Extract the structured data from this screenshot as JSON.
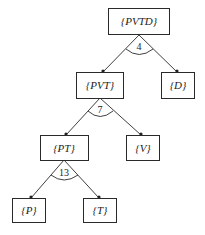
{
  "diagram": {
    "type": "and-decomposition-tree",
    "nodes": [
      {
        "id": "PVTD",
        "label": "{PVTD}"
      },
      {
        "id": "PVT",
        "label": "{PVT}"
      },
      {
        "id": "D",
        "label": "{D}"
      },
      {
        "id": "PT",
        "label": "{PT}"
      },
      {
        "id": "V",
        "label": "{V}"
      },
      {
        "id": "P",
        "label": "{P}"
      },
      {
        "id": "T",
        "label": "{T}"
      }
    ],
    "splits": [
      {
        "parent": "PVTD",
        "children": [
          "PVT",
          "D"
        ],
        "weight": "4"
      },
      {
        "parent": "PVT",
        "children": [
          "PT",
          "V"
        ],
        "weight": "7"
      },
      {
        "parent": "PT",
        "children": [
          "P",
          "T"
        ],
        "weight": "13"
      }
    ]
  }
}
